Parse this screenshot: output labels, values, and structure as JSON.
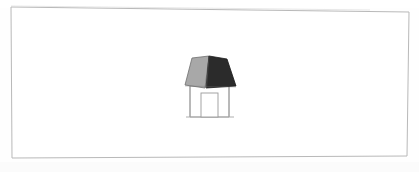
{
  "page": {
    "title": "House Sketch",
    "width": 419,
    "height": 172,
    "background_color": "#fefefe",
    "medium": "scanned paper drawing"
  },
  "frame": {
    "name": "border-rectangle",
    "description": "thin hand/printed rectangular border, slightly skewed",
    "stroke_color": "#b9b9b9",
    "stroke_width": 1,
    "fill_color": "#ffffff",
    "corners": {
      "top_left": [
        11,
        7
      ],
      "top_right": [
        409,
        12
      ],
      "bottom_right": [
        407,
        156
      ],
      "bottom_left": [
        12,
        158
      ]
    }
  },
  "drawing": {
    "name": "house",
    "subject": "simple 3D house with gabled roof and door",
    "center": [
      210,
      86
    ],
    "bounds": {
      "x": 185,
      "y": 55,
      "width": 52,
      "height": 63
    },
    "parts": [
      {
        "name": "roof-left-face",
        "label": "Roof left slope",
        "fill_color": "#a8a8a8",
        "stroke_color": "#6e6e6e",
        "points": "209,56 192,58 185,85 205,88"
      },
      {
        "name": "roof-right-face",
        "label": "Roof right slope",
        "fill_color": "#2b2b2b",
        "stroke_color": "#1b1b1b",
        "points": "209,56 227,59 236,86 206,88"
      },
      {
        "name": "wall-front",
        "label": "Front wall",
        "fill_color": "#ffffff",
        "stroke_color": "#9a9a9a",
        "points": "190,86 190,117 229,117 229,86"
      },
      {
        "name": "wall-side-left",
        "label": "Left side wall edge",
        "fill_color": "#fcfcfc",
        "stroke_color": "#9a9a9a",
        "points": "190,86 190,117"
      },
      {
        "name": "door",
        "label": "Door opening",
        "fill_color": "#ffffff",
        "stroke_color": "#9a9a9a",
        "x": 201,
        "y": 93,
        "width": 17,
        "height": 24
      },
      {
        "name": "ground-line",
        "label": "Ground / base line",
        "stroke_color": "#a5a5a5",
        "points": "186,117 234,117"
      }
    ],
    "palette": {
      "roof_light": "#a8a8a8",
      "roof_dark": "#2b2b2b",
      "wall": "#ffffff",
      "outline": "#9a9a9a",
      "paper": "#fefefe"
    }
  },
  "annotations": {
    "text_items": []
  }
}
